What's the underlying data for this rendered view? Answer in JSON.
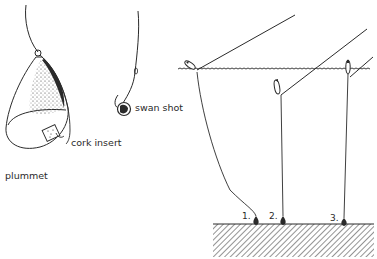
{
  "diagram": {
    "labels": {
      "plummet": "plummet",
      "cork_insert": "cork insert",
      "swan_shot": "swan shot"
    },
    "positions": {
      "one": "1.",
      "two": "2.",
      "three": "3."
    },
    "colors": {
      "ink": "#2a2a2a",
      "background": "#ffffff"
    }
  }
}
